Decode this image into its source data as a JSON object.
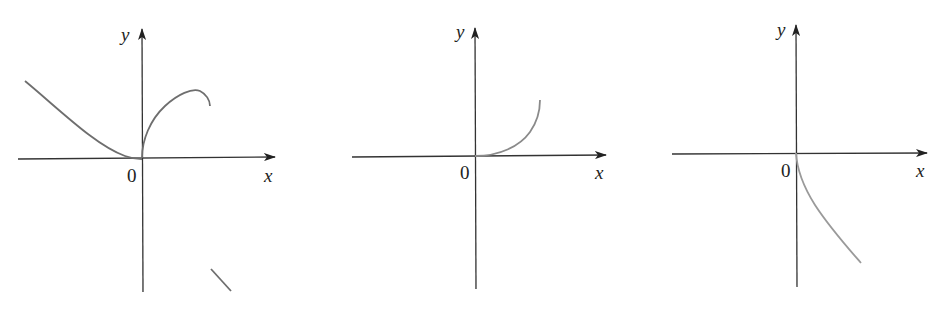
{
  "colors": {
    "axis": "#333333",
    "curve": "#6e6e6e",
    "curve_light": "#9a9a9a",
    "background": "#ffffff"
  },
  "graphs": [
    {
      "id": "graph-1",
      "x_label": "x",
      "y_label": "y",
      "origin_label": "0",
      "description": "Curve decreasing from upper-left to origin with horizontal tangent; right branch rises with vertical tangent at origin, peaks, then turns down; small isolated line segment in lower-right quadrant"
    },
    {
      "id": "graph-2",
      "x_label": "x",
      "y_label": "y",
      "origin_label": "0",
      "description": "Curve starting at origin with horizontal tangent, increasing and concave up for x > 0"
    },
    {
      "id": "graph-3",
      "x_label": "x",
      "y_label": "y",
      "origin_label": "0",
      "description": "Curve starting at origin with vertical tangent, decreasing for x > 0"
    }
  ]
}
